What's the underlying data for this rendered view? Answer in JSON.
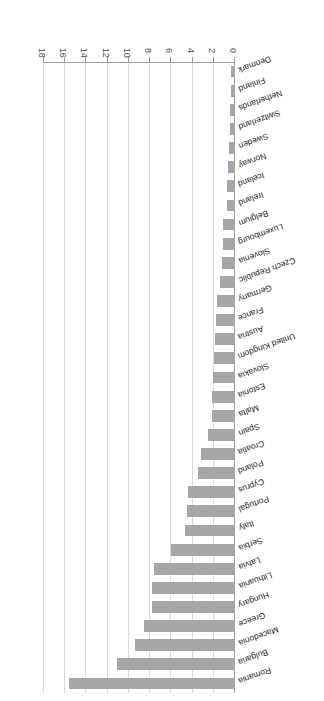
{
  "chart_data": {
    "type": "bar",
    "orientation": "horizontal",
    "title": "",
    "subtitle": "",
    "xlabel": "",
    "ylabel": "",
    "xlim": [
      0,
      18
    ],
    "grid": true,
    "legend": null,
    "legend_position": "none",
    "bar_color": "#a6a6a6",
    "axis_color": "#9a9a9a",
    "grid_color": "#d9d9d9",
    "tick_labels": [
      "0",
      "2",
      "4",
      "6",
      "8",
      "10",
      "12",
      "14",
      "16",
      "18"
    ],
    "ticks": [
      0,
      2,
      4,
      6,
      8,
      10,
      12,
      14,
      16,
      18
    ],
    "categories": [
      "Romania",
      "Bulgaria",
      "Macedonia",
      "Greece",
      "Hungary",
      "Lithuania",
      "Latvia",
      "Serbia",
      "Italy",
      "Portugal",
      "Cyprus",
      "Poland",
      "Croatia",
      "Spain",
      "Malta",
      "Estonia",
      "Slovakia",
      "United Kingdom",
      "Austria",
      "France",
      "Germany",
      "Czech Republic",
      "Slovenia",
      "Luxembourg",
      "Belgium",
      "Ireland",
      "Iceland",
      "Norway",
      "Sweden",
      "Switzerland",
      "Netherlands",
      "Finland",
      "Denmark"
    ],
    "values": [
      15.6,
      11.1,
      9.4,
      8.6,
      7.8,
      7.8,
      7.6,
      6.0,
      4.7,
      4.5,
      4.4,
      3.5,
      3.2,
      2.5,
      2.2,
      2.2,
      2.1,
      2.0,
      1.9,
      1.8,
      1.7,
      1.4,
      1.2,
      1.1,
      1.1,
      0.8,
      0.8,
      0.7,
      0.6,
      0.5,
      0.45,
      0.4,
      0.35
    ]
  }
}
